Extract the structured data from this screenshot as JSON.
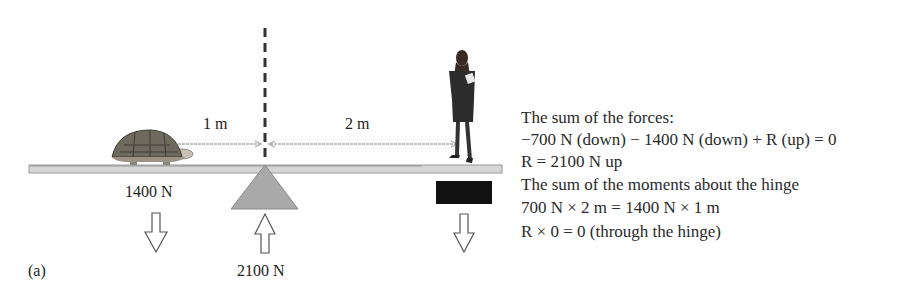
{
  "figure": {
    "panel_label": "(a)",
    "distances": {
      "left": "1 m",
      "right": "2 m"
    },
    "forces": {
      "tortoise": "1400 N",
      "pivot": "2100 N"
    },
    "colors": {
      "beam": "#d4d4d4",
      "pivot": "#a8a8a8",
      "block": "#111111",
      "dashed_line": "#333333"
    }
  },
  "explanation": {
    "lines": [
      "The sum of the forces:",
      "−700 N (down) − 1400 N (down) + R (up) = 0",
      "R = 2100 N up",
      "The sum of the moments about the hinge",
      "700 N × 2 m = 1400 N × 1 m",
      "R × 0 = 0 (through the hinge)"
    ]
  }
}
